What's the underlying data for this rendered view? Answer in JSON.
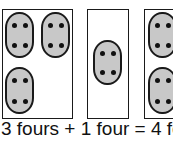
{
  "caption": "3 fours + 1 four = 4 fours",
  "colors": {
    "oval_fill": "#c8c8c8",
    "stroke": "#1a1a1a",
    "background": "#ffffff"
  },
  "groups": [
    {
      "label": "box-1",
      "oval_count": 3,
      "dots_per_oval": 4
    },
    {
      "label": "box-2",
      "oval_count": 1,
      "dots_per_oval": 4
    },
    {
      "label": "box-3",
      "oval_count": 2,
      "dots_per_oval": 4,
      "partially_visible": true
    }
  ]
}
